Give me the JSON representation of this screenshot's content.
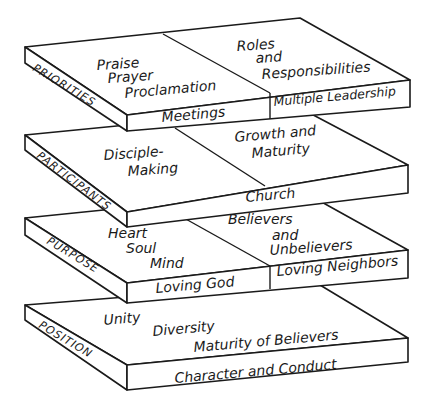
{
  "diagram": {
    "type": "stacked isometric layers",
    "colors": {
      "ink": "#1a1a1a",
      "paper": "#ffffff"
    },
    "layers": [
      {
        "side_label": "PRIORITIES",
        "left_top": [
          "Praise",
          "Prayer",
          "Proclamation"
        ],
        "right_top": [
          "Roles",
          "and",
          "Responsibilities"
        ],
        "left_front": "Meetings",
        "right_front": "Multiple Leadership"
      },
      {
        "side_label": "PARTICIPANTS",
        "left_top": [
          "Disciple-",
          "Making"
        ],
        "right_top": [
          "Growth and",
          "Maturity"
        ],
        "front": "Church"
      },
      {
        "side_label": "PURPOSE",
        "left_top": [
          "Heart",
          "Soul",
          "Mind"
        ],
        "right_top": [
          "Believers",
          "and",
          "Unbelievers"
        ],
        "left_front": "Loving God",
        "right_front": "Loving Neighbors"
      },
      {
        "side_label": "POSITION",
        "top": [
          "Unity",
          "Diversity",
          "Maturity of Believers"
        ],
        "front": "Character and Conduct"
      }
    ]
  }
}
